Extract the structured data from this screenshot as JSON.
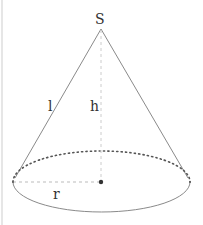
{
  "diagram": {
    "type": "cone",
    "labels": {
      "apex": "S",
      "slant_height": "l",
      "height": "h",
      "radius": "r"
    },
    "colors": {
      "stroke": "#8a8a8a",
      "dotted": "#555555",
      "text": "#333333",
      "border": "#e6e6e6"
    }
  }
}
